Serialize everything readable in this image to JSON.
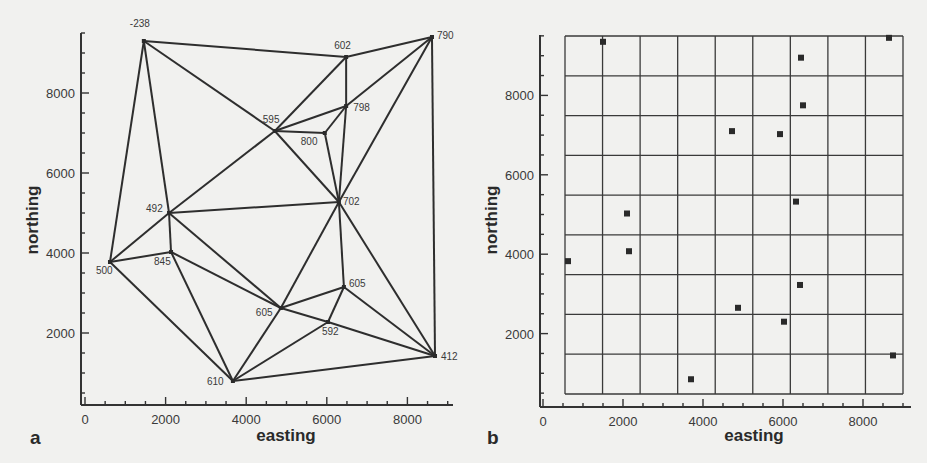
{
  "figure": {
    "panels": [
      {
        "id": "a",
        "letter": "a",
        "xlabel": "easting",
        "ylabel": "northing"
      },
      {
        "id": "b",
        "letter": "b",
        "xlabel": "easting",
        "ylabel": "northing"
      }
    ]
  },
  "chart_data": [
    {
      "type": "scatter",
      "subtype": "triangulation-network",
      "panel": "a",
      "title": "",
      "xlabel": "easting",
      "ylabel": "northing",
      "xlim": [
        0,
        9200
      ],
      "ylim": [
        0,
        9500
      ],
      "xticks": [
        0,
        2000,
        4000,
        6000,
        8000
      ],
      "yticks": [
        2000,
        4000,
        6000,
        8000
      ],
      "grid": false,
      "nodes": [
        {
          "id": "n1",
          "label": "-238",
          "x": 1460,
          "y": 9300,
          "label_dx": -14,
          "label_dy": -14
        },
        {
          "id": "n2",
          "label": "602",
          "x": 6480,
          "y": 8900,
          "label_dx": -12,
          "label_dy": -8
        },
        {
          "id": "n3",
          "label": "790",
          "x": 8610,
          "y": 9400,
          "label_dx": 5,
          "label_dy": 2
        },
        {
          "id": "n4",
          "label": "798",
          "x": 6480,
          "y": 7675,
          "label_dx": 7,
          "label_dy": 5
        },
        {
          "id": "n5",
          "label": "595",
          "x": 4710,
          "y": 7050,
          "label_dx": -12,
          "label_dy": -8
        },
        {
          "id": "n6",
          "label": "800",
          "x": 5950,
          "y": 7000,
          "label_dx": -24,
          "label_dy": 12
        },
        {
          "id": "n7",
          "label": "702",
          "x": 6300,
          "y": 5275,
          "label_dx": 4,
          "label_dy": 3
        },
        {
          "id": "n8",
          "label": "492",
          "x": 2085,
          "y": 5000,
          "label_dx": -23,
          "label_dy": -1
        },
        {
          "id": "n9",
          "label": "845",
          "x": 2135,
          "y": 4025,
          "label_dx": -17,
          "label_dy": 13
        },
        {
          "id": "n10",
          "label": "500",
          "x": 620,
          "y": 3775,
          "label_dx": -14,
          "label_dy": 12
        },
        {
          "id": "n11",
          "label": "605",
          "x": 6425,
          "y": 3150,
          "label_dx": 5,
          "label_dy": 0
        },
        {
          "id": "n12",
          "label": "605",
          "x": 4860,
          "y": 2625,
          "label_dx": -25,
          "label_dy": 8
        },
        {
          "id": "n13",
          "label": "592",
          "x": 6030,
          "y": 2275,
          "label_dx": -6,
          "label_dy": 13
        },
        {
          "id": "n14",
          "label": "610",
          "x": 3670,
          "y": 800,
          "label_dx": -26,
          "label_dy": 4
        },
        {
          "id": "n15",
          "label": "412",
          "x": 8685,
          "y": 1425,
          "label_dx": 6,
          "label_dy": 4
        }
      ],
      "edges": [
        [
          "n1",
          "n2"
        ],
        [
          "n1",
          "n10"
        ],
        [
          "n1",
          "n8"
        ],
        [
          "n1",
          "n5"
        ],
        [
          "n5",
          "n7"
        ],
        [
          "n5",
          "n2"
        ],
        [
          "n5",
          "n4"
        ],
        [
          "n5",
          "n6"
        ],
        [
          "n5",
          "n8"
        ],
        [
          "n6",
          "n4"
        ],
        [
          "n6",
          "n7"
        ],
        [
          "n2",
          "n4"
        ],
        [
          "n2",
          "n3"
        ],
        [
          "n3",
          "n4"
        ],
        [
          "n3",
          "n7"
        ],
        [
          "n3",
          "n15"
        ],
        [
          "n4",
          "n7"
        ],
        [
          "n8",
          "n7"
        ],
        [
          "n8",
          "n10"
        ],
        [
          "n8",
          "n9"
        ],
        [
          "n8",
          "n12"
        ],
        [
          "n9",
          "n10"
        ],
        [
          "n9",
          "n12"
        ],
        [
          "n9",
          "n14"
        ],
        [
          "n10",
          "n14"
        ],
        [
          "n7",
          "n12"
        ],
        [
          "n7",
          "n11"
        ],
        [
          "n7",
          "n15"
        ],
        [
          "n11",
          "n12"
        ],
        [
          "n11",
          "n13"
        ],
        [
          "n11",
          "n15"
        ],
        [
          "n12",
          "n13"
        ],
        [
          "n13",
          "n15"
        ],
        [
          "n12",
          "n14"
        ],
        [
          "n13",
          "n14"
        ],
        [
          "n14",
          "n15"
        ]
      ]
    },
    {
      "type": "scatter",
      "subtype": "points-on-grid",
      "panel": "b",
      "title": "",
      "xlabel": "easting",
      "ylabel": "northing",
      "xlim": [
        0,
        9200
      ],
      "ylim": [
        0,
        9500
      ],
      "xticks": [
        0,
        2000,
        4000,
        6000,
        8000
      ],
      "yticks": [
        2000,
        4000,
        6000,
        8000
      ],
      "grid": true,
      "grid_cells": {
        "columns": 9,
        "rows": 9,
        "x_start": 550,
        "x_end": 9000,
        "y_start": 550,
        "y_end": 9500
      },
      "points": [
        {
          "x": 1500,
          "y": 9350
        },
        {
          "x": 6450,
          "y": 8950
        },
        {
          "x": 8650,
          "y": 9450
        },
        {
          "x": 6500,
          "y": 7750
        },
        {
          "x": 4725,
          "y": 7100
        },
        {
          "x": 5925,
          "y": 7025
        },
        {
          "x": 6325,
          "y": 5325
        },
        {
          "x": 2100,
          "y": 5025
        },
        {
          "x": 2150,
          "y": 4075
        },
        {
          "x": 625,
          "y": 3825
        },
        {
          "x": 6425,
          "y": 3225
        },
        {
          "x": 4875,
          "y": 2650
        },
        {
          "x": 6025,
          "y": 2300
        },
        {
          "x": 3700,
          "y": 850
        },
        {
          "x": 8750,
          "y": 1450
        }
      ]
    }
  ]
}
